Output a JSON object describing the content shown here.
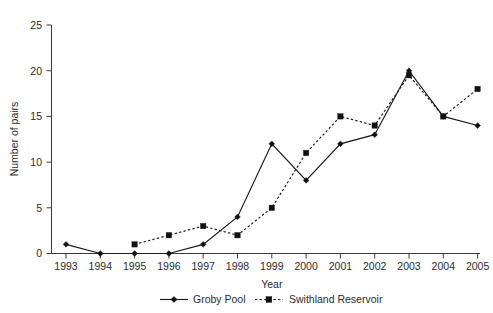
{
  "chart_data": {
    "type": "line",
    "title": "",
    "xlabel": "Year",
    "ylabel": "Number of pairs",
    "categories": [
      "1993",
      "1994",
      "1995",
      "1996",
      "1997",
      "1998",
      "1999",
      "2000",
      "2001",
      "2002",
      "2003",
      "2004",
      "2005"
    ],
    "x": [
      1993,
      1994,
      1995,
      1996,
      1997,
      1998,
      1999,
      2000,
      2001,
      2002,
      2003,
      2004,
      2005
    ],
    "xlim": [
      1992.5,
      2005.5
    ],
    "ylim": [
      0,
      25
    ],
    "yticks": [
      0,
      5,
      10,
      15,
      20,
      25
    ],
    "ytick_labels": [
      "0",
      "5",
      "10",
      "15",
      "20",
      "25"
    ],
    "grid": false,
    "legend_position": "bottom",
    "series": [
      {
        "name": "Groby Pool",
        "marker": "diamond",
        "linestyle": "solid",
        "color": "#111111",
        "values": [
          1,
          0,
          0,
          0,
          1,
          4,
          12,
          8,
          12,
          13,
          20,
          15,
          14
        ]
      },
      {
        "name": "Swithland Reservoir",
        "marker": "square",
        "linestyle": "dashed",
        "color": "#111111",
        "values": [
          null,
          null,
          1,
          2,
          3,
          2,
          5,
          11,
          15,
          14,
          19.5,
          15,
          18
        ]
      }
    ]
  },
  "axes": {
    "y_axis_label": "Number of pairs",
    "x_axis_label": "Year"
  },
  "legend": {
    "items": [
      {
        "label": "Groby Pool",
        "marker": "diamond-marker",
        "style": "solid"
      },
      {
        "label": "Swithland Reservoir",
        "marker": "square-marker",
        "style": "dashed"
      }
    ]
  },
  "colors": {
    "background": "#ffffff",
    "ink": "#1a1a1a",
    "axis": "#3a3a3a"
  }
}
